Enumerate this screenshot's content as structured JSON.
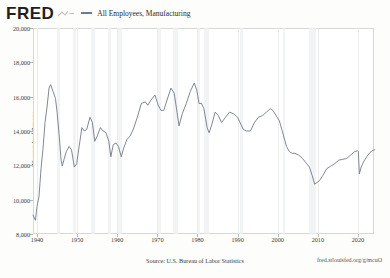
{
  "header": {
    "logo_text": "FRED",
    "logo_mark_icon": "fred-squiggle-icon",
    "legend": [
      {
        "label": "All Employees, Manufacturing",
        "color": "#6f7b8a"
      }
    ]
  },
  "footer": {
    "source": "Source: U.S. Bureau of Labor Statistics",
    "fred_url": "fred.stlouisfed.org/g/mcuO"
  },
  "chart_data": {
    "type": "line",
    "title": "All Employees, Manufacturing",
    "xlabel": "",
    "ylabel": "Thousands of Persons",
    "xlim": [
      1939,
      2024
    ],
    "ylim": [
      8000,
      20000
    ],
    "grid": true,
    "legend_position": "top",
    "xticks": [
      "1940",
      "1950",
      "1960",
      "1970",
      "1980",
      "1990",
      "2000",
      "2010",
      "2020"
    ],
    "xtick_values": [
      1940,
      1950,
      1960,
      1970,
      1980,
      1990,
      2000,
      2010,
      2020
    ],
    "yticks": [
      "20,000",
      "18,000",
      "16,000",
      "14,000",
      "12,000",
      "10,000",
      "8,000"
    ],
    "ytick_values": [
      20000,
      18000,
      16000,
      14000,
      12000,
      10000,
      8000
    ],
    "recession_bands": [
      [
        1945.08,
        1945.75
      ],
      [
        1948.92,
        1949.83
      ],
      [
        1953.5,
        1954.42
      ],
      [
        1957.67,
        1958.33
      ],
      [
        1960.25,
        1961.17
      ],
      [
        1969.92,
        1970.92
      ],
      [
        1973.92,
        1975.25
      ],
      [
        1980.08,
        1980.58
      ],
      [
        1981.5,
        1982.92
      ],
      [
        1990.5,
        1991.25
      ],
      [
        2001.25,
        2001.92
      ],
      [
        2007.92,
        2009.5
      ],
      [
        2020.08,
        2020.33
      ]
    ],
    "series": [
      {
        "name": "All Employees, Manufacturing",
        "color": "#6f7b8a",
        "x": [
          1939.0,
          1939.6,
          1940.0,
          1940.5,
          1941.0,
          1941.5,
          1942.0,
          1942.5,
          1943.0,
          1943.4,
          1944.0,
          1944.6,
          1945.0,
          1945.5,
          1946.0,
          1946.3,
          1946.8,
          1947.3,
          1948.0,
          1948.6,
          1949.3,
          1949.9,
          1950.5,
          1951.2,
          1951.8,
          1952.4,
          1953.2,
          1953.8,
          1954.4,
          1955.0,
          1955.8,
          1956.5,
          1957.2,
          1957.9,
          1958.4,
          1959.0,
          1959.7,
          1960.3,
          1961.0,
          1961.6,
          1962.4,
          1963.2,
          1964.0,
          1965.0,
          1966.0,
          1967.0,
          1967.6,
          1968.4,
          1969.4,
          1970.2,
          1970.9,
          1971.6,
          1972.4,
          1973.4,
          1974.2,
          1974.9,
          1975.4,
          1976.2,
          1977.2,
          1978.2,
          1979.2,
          1979.8,
          1980.4,
          1981.0,
          1981.6,
          1982.4,
          1982.9,
          1983.6,
          1984.4,
          1985.2,
          1986.0,
          1987.0,
          1988.0,
          1989.0,
          1990.0,
          1990.8,
          1991.4,
          1992.2,
          1993.2,
          1994.2,
          1995.2,
          1996.2,
          1997.2,
          1998.2,
          1998.8,
          1999.6,
          2000.4,
          2001.0,
          2001.6,
          2002.2,
          2002.9,
          2003.6,
          2004.3,
          2005.2,
          2006.2,
          2007.2,
          2007.9,
          2008.6,
          2009.2,
          2009.8,
          2010.4,
          2011.2,
          2012.2,
          2013.2,
          2014.2,
          2015.2,
          2016.2,
          2017.2,
          2018.2,
          2019.2,
          2019.9,
          2020.1,
          2020.35,
          2020.8,
          2021.4,
          2022.2,
          2023.0,
          2023.8,
          2024.2
        ],
        "y": [
          9100,
          8800,
          9600,
          10200,
          11800,
          13000,
          14500,
          15400,
          16500,
          16700,
          16300,
          15900,
          15100,
          13800,
          12300,
          11950,
          12400,
          12800,
          13100,
          12900,
          11900,
          12100,
          13100,
          14200,
          14000,
          14100,
          14800,
          14500,
          13400,
          13700,
          14200,
          14000,
          13900,
          13400,
          12500,
          13200,
          13300,
          13100,
          12500,
          13000,
          13500,
          13700,
          14100,
          14800,
          15600,
          15700,
          15500,
          15800,
          16100,
          15500,
          15200,
          15200,
          15800,
          16500,
          16200,
          15100,
          14300,
          15000,
          15600,
          16300,
          16800,
          16400,
          15600,
          15600,
          15300,
          14200,
          13900,
          14400,
          15100,
          14900,
          14500,
          14800,
          15100,
          15000,
          14800,
          14400,
          14100,
          14000,
          14000,
          14500,
          14800,
          14900,
          15100,
          15300,
          15200,
          14900,
          14600,
          14100,
          13600,
          13100,
          12800,
          12700,
          12700,
          12600,
          12400,
          12100,
          11900,
          11400,
          10900,
          11000,
          11100,
          11400,
          11800,
          11950,
          12100,
          12300,
          12350,
          12400,
          12600,
          12800,
          12850,
          12800,
          11500,
          11900,
          12200,
          12500,
          12750,
          12880,
          12900
        ]
      }
    ]
  }
}
